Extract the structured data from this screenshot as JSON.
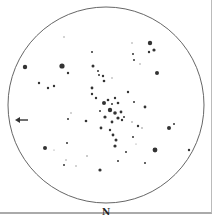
{
  "sketch": {
    "title": "Star cluster eyepiece sketch",
    "orientation_label": "N",
    "field": {
      "cx": 106,
      "cy": 105,
      "r": 98,
      "stroke": "#555"
    },
    "arrow": {
      "x": 22,
      "y": 120,
      "direction": "left"
    },
    "stars": [
      [
        25,
        67,
        2.2
      ],
      [
        62,
        66,
        2.6
      ],
      [
        54,
        86,
        1.2
      ],
      [
        68,
        73,
        1.2
      ],
      [
        48,
        88,
        1.2
      ],
      [
        64,
        37,
        0.7
      ],
      [
        39,
        83,
        1.2
      ],
      [
        92,
        52,
        1.0
      ],
      [
        93,
        66,
        1.5
      ],
      [
        98,
        71,
        1.0
      ],
      [
        99,
        75,
        1.0
      ],
      [
        104,
        81,
        1.3
      ],
      [
        103,
        76,
        1.2
      ],
      [
        132,
        43,
        0.7
      ],
      [
        150,
        43,
        2.2
      ],
      [
        149,
        52,
        1.2
      ],
      [
        154,
        50,
        1.6
      ],
      [
        133,
        54,
        1.0
      ],
      [
        134,
        60,
        1.0
      ],
      [
        140,
        64,
        0.7
      ],
      [
        157,
        73,
        2.0
      ],
      [
        112,
        78,
        0.7
      ],
      [
        92,
        88,
        1.4
      ],
      [
        92,
        94,
        1.2
      ],
      [
        96,
        98,
        1.2
      ],
      [
        104,
        103,
        2.0
      ],
      [
        108,
        100,
        1.3
      ],
      [
        112,
        104,
        1.0
      ],
      [
        115,
        98,
        1.2
      ],
      [
        118,
        103,
        1.3
      ],
      [
        110,
        110,
        2.2
      ],
      [
        115,
        113,
        1.8
      ],
      [
        121,
        112,
        1.4
      ],
      [
        118,
        118,
        1.6
      ],
      [
        124,
        117,
        1.0
      ],
      [
        122,
        120,
        1.2
      ],
      [
        112,
        122,
        1.4
      ],
      [
        105,
        117,
        1.6
      ],
      [
        101,
        128,
        1.4
      ],
      [
        110,
        130,
        1.2
      ],
      [
        113,
        135,
        1.4
      ],
      [
        116,
        140,
        1.5
      ],
      [
        115,
        146,
        1.6
      ],
      [
        86,
        121,
        1.3
      ],
      [
        100,
        111,
        1.0
      ],
      [
        128,
        92,
        1.2
      ],
      [
        134,
        102,
        1.0
      ],
      [
        145,
        107,
        1.4
      ],
      [
        71,
        113,
        0.7
      ],
      [
        68,
        119,
        1.0
      ],
      [
        45,
        148,
        2.0
      ],
      [
        67,
        143,
        1.0
      ],
      [
        54,
        150,
        0.6
      ],
      [
        66,
        160,
        0.7
      ],
      [
        64,
        165,
        1.0
      ],
      [
        76,
        166,
        0.7
      ],
      [
        87,
        156,
        0.8
      ],
      [
        100,
        170,
        1.6
      ],
      [
        132,
        122,
        0.8
      ],
      [
        138,
        126,
        1.2
      ],
      [
        142,
        128,
        0.8
      ],
      [
        133,
        137,
        1.0
      ],
      [
        126,
        152,
        1.0
      ],
      [
        136,
        144,
        0.6
      ],
      [
        155,
        150,
        2.4
      ],
      [
        169,
        128,
        2.0
      ],
      [
        174,
        124,
        1.0
      ],
      [
        189,
        150,
        1.2
      ],
      [
        145,
        163,
        1.0
      ],
      [
        118,
        161,
        1.0
      ]
    ]
  }
}
